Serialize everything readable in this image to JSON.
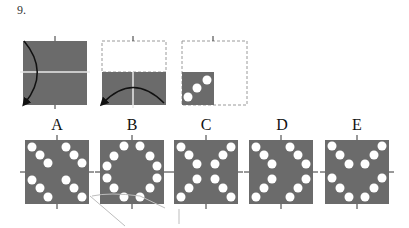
{
  "question": {
    "number": "9.",
    "fold_steps": [
      {
        "id": "step-1",
        "description": "Square folded along horizontal center line; left edge arc arrow from top to bottom"
      },
      {
        "id": "step-2",
        "description": "Folded lower half; arc arrow from bottom-left to bottom-right"
      },
      {
        "id": "step-3",
        "description": "Folded bottom-left quarter with three punched holes on diagonal"
      }
    ],
    "options": [
      {
        "label": "A",
        "pattern": "two parallel diagonal lines of 3 holes per quadrant row"
      },
      {
        "label": "B",
        "pattern": "ring of 12 holes"
      },
      {
        "label": "C",
        "pattern": "X shape of holes"
      },
      {
        "label": "D",
        "pattern": "two chevrons pointing right"
      },
      {
        "label": "E",
        "pattern": "two V shapes stacked"
      }
    ]
  },
  "colors": {
    "panel": "#6b6b6b",
    "hole": "#ffffff",
    "dashed": "#9a9a9a",
    "arrow": "#111111"
  }
}
